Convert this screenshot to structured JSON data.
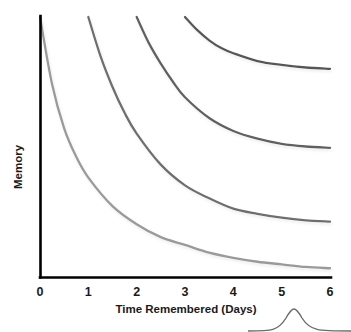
{
  "chart_data": {
    "type": "line",
    "title": "",
    "xlabel": "Time Remembered (Days)",
    "ylabel": "Memory",
    "xlim": [
      0,
      6
    ],
    "ylim": [
      0,
      100
    ],
    "xticks": [
      "0",
      "1",
      "2",
      "3",
      "4",
      "5",
      "6"
    ],
    "yticks": [],
    "grid": false,
    "legend": false,
    "legend_position": "none",
    "series": [
      {
        "name": "Curve 1",
        "color": "#9a9a9a",
        "start_day": 0,
        "x": [
          0,
          0.25,
          0.5,
          0.75,
          1,
          1.5,
          2,
          2.5,
          3,
          3.5,
          4,
          4.5,
          5,
          5.5,
          6
        ],
        "values": [
          100,
          74,
          57,
          46,
          38,
          27,
          20,
          15,
          12,
          9,
          7,
          5.5,
          4.5,
          3.5,
          3
        ]
      },
      {
        "name": "Curve 2",
        "color": "#6e6e6e",
        "start_day": 1,
        "x": [
          1,
          1.25,
          1.5,
          1.75,
          2,
          2.5,
          3,
          3.5,
          4,
          4.5,
          5,
          5.5,
          6
        ],
        "values": [
          100,
          85,
          73,
          63,
          55,
          43,
          35,
          30,
          26,
          24,
          22.5,
          21.5,
          21
        ]
      },
      {
        "name": "Curve 3",
        "color": "#616161",
        "start_day": 2,
        "x": [
          2,
          2.25,
          2.5,
          2.75,
          3,
          3.5,
          4,
          4.5,
          5,
          5.5,
          6
        ],
        "values": [
          100,
          90,
          82,
          75,
          69,
          61,
          56,
          53,
          51,
          50,
          49.5
        ]
      },
      {
        "name": "Curve 4",
        "color": "#575757",
        "start_day": 3,
        "x": [
          3,
          3.25,
          3.5,
          3.75,
          4,
          4.5,
          5,
          5.5,
          6
        ],
        "values": [
          100,
          95,
          91,
          88,
          86,
          83,
          81.5,
          80.5,
          80
        ]
      }
    ],
    "annotations": [
      {
        "name": "grouping-brace",
        "label": "",
        "position": "bottom-right"
      }
    ]
  },
  "colors": {
    "axis": "#000000",
    "text": "#1a1a1a",
    "background": "#ffffff",
    "brace": "#6b6b6b"
  }
}
